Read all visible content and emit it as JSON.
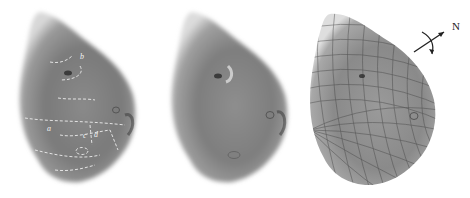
{
  "figure": {
    "panels": [
      {
        "id": "annotated-features",
        "annotations": [
          "a",
          "b",
          "c",
          "d"
        ]
      },
      {
        "id": "plain-image"
      },
      {
        "id": "coordinate-grid-overlay"
      }
    ],
    "north_arrow": {
      "label": "N"
    }
  }
}
